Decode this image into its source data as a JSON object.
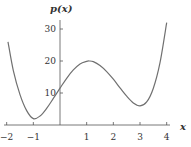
{
  "chart_data": {
    "type": "line",
    "title": "",
    "xlabel": "x",
    "ylabel": "p(x)",
    "xlim": [
      -2,
      4
    ],
    "ylim": [
      0,
      33
    ],
    "grid": false,
    "x_ticks": [
      -2,
      -1,
      1,
      2,
      3,
      4
    ],
    "x_tick_labels": [
      "−2",
      "−1",
      "1",
      "2",
      "3",
      "4"
    ],
    "y_ticks": [
      10,
      20,
      30
    ],
    "y_tick_labels": [
      "10",
      "20",
      "30"
    ],
    "series": [
      {
        "name": "p(x)",
        "x": [
          -1.95,
          -1.75,
          -1.5,
          -1.25,
          -1.0,
          -0.75,
          -0.5,
          -0.25,
          0.0,
          0.25,
          0.5,
          0.75,
          1.0,
          1.1,
          1.25,
          1.5,
          1.75,
          2.0,
          2.25,
          2.5,
          2.75,
          3.0,
          3.25,
          3.5,
          3.75,
          4.0
        ],
        "y": [
          26,
          17,
          9.5,
          4.5,
          2,
          2.8,
          5.2,
          8.3,
          11.5,
          14.6,
          17.2,
          19.1,
          19.9,
          20,
          19.8,
          18.6,
          16.7,
          14.3,
          11.6,
          9.0,
          6.9,
          6.0,
          7.2,
          11.5,
          19.5,
          32
        ]
      }
    ],
    "annotations": []
  },
  "labels": {
    "y_axis_title": "p(x)",
    "x_axis_title": "x"
  },
  "colors": {
    "curve": "#707070",
    "axis": "#555555",
    "text": "#333333"
  }
}
